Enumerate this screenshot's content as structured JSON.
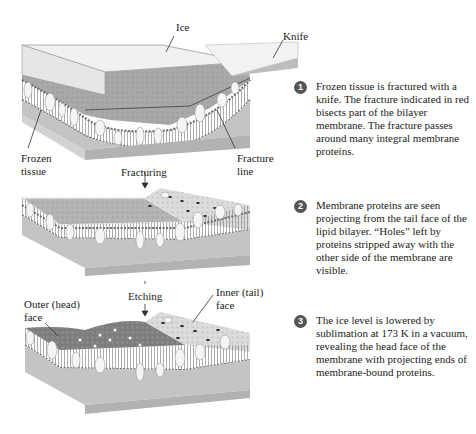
{
  "figure": {
    "panels": [
      {
        "labels": {
          "ice": "Ice",
          "knife": "Knife",
          "frozen_tissue_1": "Frozen",
          "frozen_tissue_2": "tissue",
          "fracture_line_1": "Fracture",
          "fracture_line_2": "line"
        }
      },
      {
        "labels": {
          "fracturing": "Fracturing"
        }
      },
      {
        "labels": {
          "etching": "Etching",
          "outer_face_1": "Outer (head)",
          "outer_face_2": "face",
          "inner_face_1": "Inner (tail)",
          "inner_face_2": "face"
        }
      }
    ],
    "steps": [
      {
        "number": "1",
        "text": "Frozen tissue is fractured with a knife. The fracture indicated in red bisects part of the bilayer membrane. The fracture passes around many integral membrane proteins."
      },
      {
        "number": "2",
        "text": "Membrane proteins are seen projecting from the tail face of the lipid bilayer. “Holes” left by proteins stripped away with the other side of the membrane are visible."
      },
      {
        "number": "3",
        "text": "The ice level is lowered by sublimation at 173 K in a vacuum, revealing the head face of the membrane with projecting ends of membrane-bound proteins."
      }
    ],
    "colors": {
      "block_side": "#b9b9b9",
      "block_front": "#cfcfcf",
      "ice_top": "#ededed",
      "fracture_surface": "#a8a8a8",
      "head_group": "#7a7a7a",
      "protein": "#f4f4f4",
      "step_badge": "#555555"
    }
  }
}
